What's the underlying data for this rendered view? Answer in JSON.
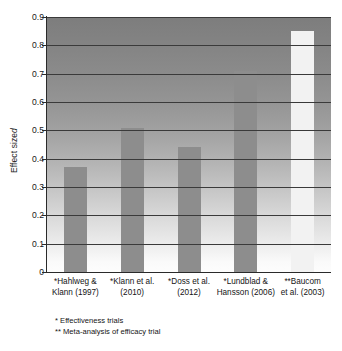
{
  "chart_data": {
    "type": "bar",
    "title": "",
    "xlabel": "",
    "ylabel": "Effect size d",
    "ylim": [
      0,
      0.9
    ],
    "grid": true,
    "legend": "none",
    "categories": [
      "*Hahlweg & Klann (1997)",
      "*Klann et al. (2010)",
      "*Doss et al. (2012)",
      "*Lundblad & Hansson (2006)",
      "**Baucom et al. (2003)"
    ],
    "category_lines": [
      [
        "*Hahlweg &",
        "Klann (1997)"
      ],
      [
        "*Klann et al.",
        "(2010)"
      ],
      [
        "*Doss et al.",
        "(2012)"
      ],
      [
        "*Lundblad &",
        "Hansson (2006)"
      ],
      [
        "**Baucom",
        "et al. (2003)"
      ]
    ],
    "values": [
      0.37,
      0.51,
      0.44,
      0.71,
      0.85
    ],
    "bar_colors": [
      "#8d8d8d",
      "#8d8d8d",
      "#8d8d8d",
      "#8d8d8d",
      "#f2f2f2"
    ],
    "ytick_labels": [
      "0.9",
      "0.8",
      "0.7",
      "0.6",
      "0.5",
      "0.4",
      "0.3",
      "0.2",
      "0.1",
      "0"
    ],
    "ytick_values": [
      0.9,
      0.8,
      0.7,
      0.6,
      0.5,
      0.4,
      0.3,
      0.2,
      0.1,
      0
    ]
  },
  "axis": {
    "y_title_text": "Effect size ",
    "y_title_symbol": "d"
  },
  "footnotes": [
    "* Effectiveness trials",
    "** Meta-analysis of efficacy trial"
  ]
}
